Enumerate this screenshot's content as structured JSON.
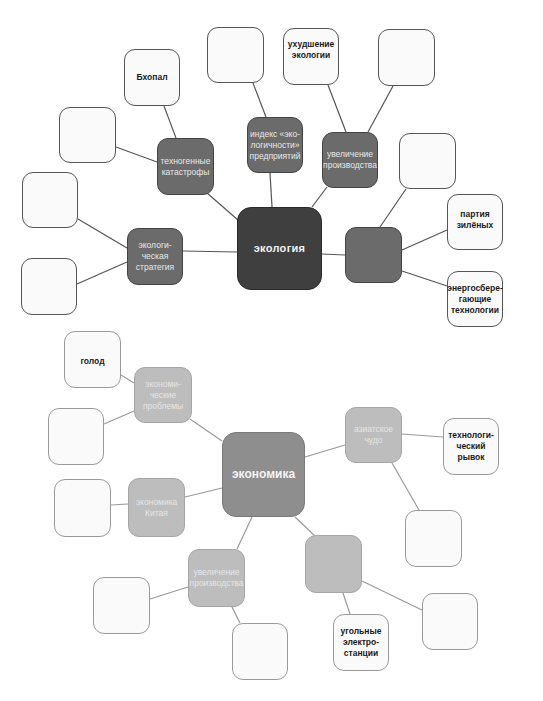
{
  "ecology_map": {
    "center": "экология",
    "branches": {
      "tech_disasters": "техногенные\nкатастрофы",
      "eco_index": "индекс «эко-\nлогичности»\nпредприятий",
      "production_growth": "увеличение\nпроизводства",
      "eco_strategy": "экологи-\nческая\nстратегия",
      "unlabeled_right": ""
    },
    "leaves": {
      "bhopal": "Бхопал",
      "eco_decline": "ухудшение\nэкологии",
      "green_party": "партия\nзилёных",
      "energy_saving": "энергосбере-\nгающие\nтехнологии",
      "empty": ""
    }
  },
  "economy_map": {
    "center": "экономика",
    "branches": {
      "economic_problems": "экономи-\nческие\nпроблемы",
      "china_economy": "экономика\nКитая",
      "asian_miracle": "азиатское\nчудо",
      "production_growth": "увеличение\nпроизводства",
      "unlabeled_right": ""
    },
    "leaves": {
      "hunger": "голод",
      "tech_leap": "технологи-\nческий рывок",
      "coal_plants": "угольные\nэлектро-\nстанции",
      "empty": ""
    }
  },
  "colors": {
    "dark_center": "#3f3f3f",
    "dark_branch": "#6b6b6b",
    "light_center": "#8e8e8e",
    "light_branch": "#bdbdbd",
    "leaf_fill": "#fafafa",
    "dark_line": "#555555",
    "light_line": "#9a9a9a"
  }
}
